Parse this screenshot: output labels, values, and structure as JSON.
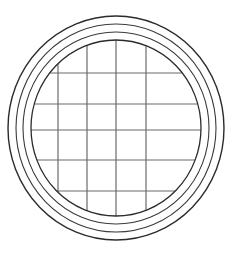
{
  "canvas": {
    "width": 235,
    "height": 254,
    "background_color": "#ffffff",
    "title": "Circular grid window line drawing"
  },
  "figure": {
    "name": "round-window-with-muntin-grid",
    "center_x": 116,
    "center_y": 128,
    "stroke_color": "#2b2b2b",
    "grid_stroke_color": "#6b6b6b",
    "fill": "none"
  },
  "rings": [
    {
      "label": "outer-ring",
      "rx": 108,
      "ry": 112,
      "stroke_width": 1.4,
      "stroke_color": "#2b2b2b"
    },
    {
      "label": "second-ring",
      "rx": 100,
      "ry": 104,
      "stroke_width": 1.1,
      "stroke_color": "#3a3a3a"
    },
    {
      "label": "third-ring",
      "rx": 93,
      "ry": 96,
      "stroke_width": 1.1,
      "stroke_color": "#3a3a3a"
    },
    {
      "label": "inner-ring",
      "rx": 85,
      "ry": 88,
      "stroke_width": 1.3,
      "stroke_color": "#2b2b2b"
    }
  ],
  "grid": {
    "vertical_count": 4,
    "horizontal_count": 5,
    "stroke_width": 1.2,
    "stroke_color": "#6b6b6b",
    "vertical_x": [
      58,
      87,
      116,
      146
    ],
    "horizontal_y": [
      73,
      104,
      130,
      160,
      191
    ],
    "clip_ring": "inner-ring"
  }
}
